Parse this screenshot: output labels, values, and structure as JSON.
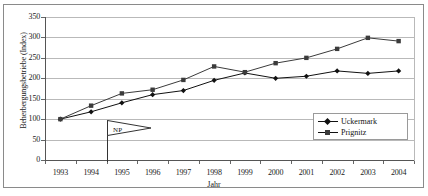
{
  "chart_data": {
    "type": "line",
    "title": "",
    "xlabel": "Jahr",
    "ylabel": "Beherbergungsbetriebe (Index)",
    "categories": [
      "1993",
      "1994",
      "1995",
      "1996",
      "1997",
      "1998",
      "1999",
      "2000",
      "2001",
      "2002",
      "2003",
      "2004"
    ],
    "ylim": [
      0,
      350
    ],
    "yticks": [
      0,
      50,
      100,
      150,
      200,
      250,
      300,
      350
    ],
    "grid": true,
    "legend_position": "bottom-right",
    "series": [
      {
        "name": "Uckermark",
        "marker": "diamond",
        "color": "#111111",
        "values": [
          100,
          118,
          140,
          160,
          170,
          195,
          213,
          200,
          205,
          218,
          212,
          218
        ]
      },
      {
        "name": "Prignitz",
        "marker": "square",
        "color": "#3b3b3b",
        "values": [
          100,
          133,
          163,
          172,
          196,
          229,
          215,
          237,
          250,
          272,
          299,
          291
        ]
      }
    ],
    "annotations": [
      {
        "label": "NP",
        "shape": "flag",
        "at_category": "1995"
      }
    ]
  }
}
